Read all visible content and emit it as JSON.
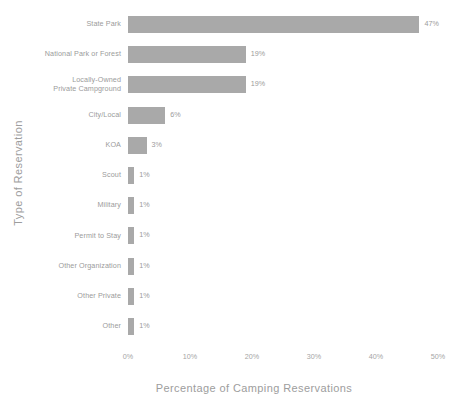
{
  "chart_data": {
    "type": "bar",
    "orientation": "horizontal",
    "title": "",
    "xlabel": "Percentage of Camping Reservations",
    "ylabel": "Type of Reservation",
    "categories": [
      "State Park",
      "National Park or Forest",
      "Locally-Owned Private Campground",
      "City/Local",
      "KOA",
      "Scout",
      "Military",
      "Permit to Stay",
      "Other Organization",
      "Other Private",
      "Other"
    ],
    "category_lines": [
      [
        "State Park"
      ],
      [
        "National Park or Forest"
      ],
      [
        "Locally-Owned",
        "Private Campground"
      ],
      [
        "City/Local"
      ],
      [
        "KOA"
      ],
      [
        "Scout"
      ],
      [
        "Military"
      ],
      [
        "Permit to Stay"
      ],
      [
        "Other Organization"
      ],
      [
        "Other Private"
      ],
      [
        "Other"
      ]
    ],
    "values": [
      47,
      19,
      19,
      6,
      3,
      1,
      1,
      1,
      1,
      1,
      1
    ],
    "value_labels": [
      "47%",
      "19%",
      "19%",
      "6%",
      "3%",
      "1%",
      "1%",
      "1%",
      "1%",
      "1%",
      "1%"
    ],
    "xlim": [
      0,
      50
    ],
    "xticks": [
      0,
      10,
      20,
      30,
      40,
      50
    ],
    "xtick_labels": [
      "0%",
      "10%",
      "20%",
      "30%",
      "40%",
      "50%"
    ],
    "grid": false,
    "legend": null,
    "bar_color": "#a9a9a9",
    "text_color": "#9b9b9b",
    "background_color": "#ffffff"
  }
}
